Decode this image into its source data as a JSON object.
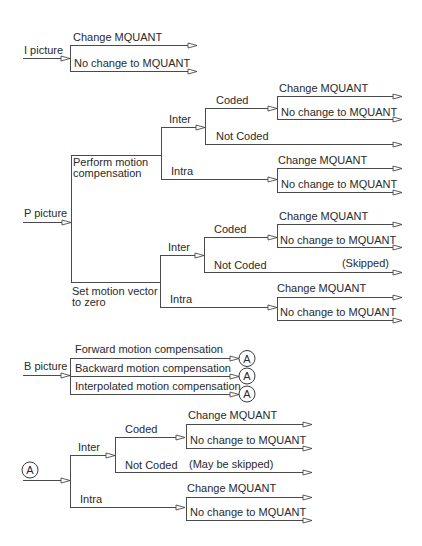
{
  "i_picture": {
    "label": "I picture",
    "change": "Change MQUANT",
    "no_change": "No change to MQUANT"
  },
  "p_picture": {
    "label": "P picture",
    "perform_mc": {
      "label_line1": "Perform motion",
      "label_line2": "compensation",
      "inter": {
        "label": "Inter",
        "coded": {
          "label": "Coded",
          "change": "Change MQUANT",
          "no_change": "No change to MQUANT"
        },
        "not_coded": {
          "label": "Not Coded"
        }
      },
      "intra": {
        "label": "Intra",
        "change": "Change MQUANT",
        "no_change": "No change to MQUANT"
      }
    },
    "zero_mv": {
      "label_line1": "Set motion vector",
      "label_line2": "to zero",
      "inter": {
        "label": "Inter",
        "coded": {
          "label": "Coded",
          "change": "Change MQUANT",
          "no_change": "No change to MQUANT"
        },
        "not_coded": {
          "label": "Not Coded",
          "note": "(Skipped)"
        }
      },
      "intra": {
        "label": "Intra",
        "change": "Change MQUANT",
        "no_change": "No change to MQUANT"
      }
    }
  },
  "b_picture": {
    "label": "B picture",
    "branches": [
      {
        "label": "Forward motion compensation",
        "connector": "A"
      },
      {
        "label": "Backward motion compensation",
        "connector": "A"
      },
      {
        "label": "Interpolated motion compensation",
        "connector": "A"
      }
    ]
  },
  "connector_a": {
    "label": "A",
    "inter": {
      "label": "Inter",
      "coded": {
        "label": "Coded",
        "change": "Change MQUANT",
        "no_change": "No change to MQUANT"
      },
      "not_coded": {
        "label": "Not Coded",
        "note": "(May be skipped)"
      }
    },
    "intra": {
      "label": "Intra",
      "change": "Change MQUANT",
      "no_change": "No change to MQUANT"
    }
  },
  "colors": {
    "line": "#4a4a4a",
    "text": "#2a2a2a",
    "background": "#ffffff"
  }
}
